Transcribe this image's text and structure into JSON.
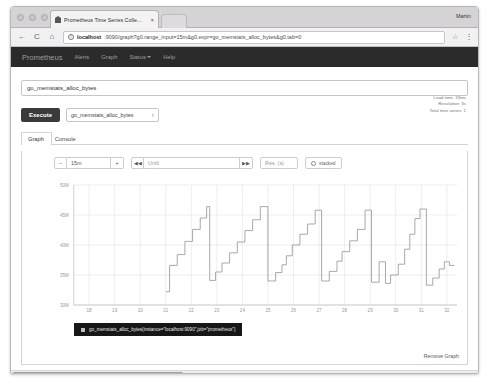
{
  "browser": {
    "tab_title": "Prometheus Time Series Colle...",
    "tab_close": "×",
    "profile_name": "Martin",
    "back_icon": "←",
    "reload_icon": "C",
    "home_icon": "⌂",
    "info_icon": "i",
    "url_host": "localhost",
    "url_path": ":9090/graph?g0.range_input=15m&g0.expr=go_memstats_alloc_bytes&g0.tab=0",
    "star_icon": "☆",
    "menu_icon": "⋮"
  },
  "navbar": {
    "brand": "Prometheus",
    "items": [
      {
        "label": "Alerts",
        "has_caret": false
      },
      {
        "label": "Graph",
        "has_caret": false
      },
      {
        "label": "Status",
        "has_caret": true
      },
      {
        "label": "Help",
        "has_caret": false
      }
    ]
  },
  "query": {
    "expression": "go_memstats_alloc_bytes",
    "placeholder": "Expression (press Shift+Enter for newlines)",
    "execute_label": "Execute",
    "metric_selected": "go_memstats_alloc_bytes",
    "select_arrows": "↕",
    "stats": {
      "load_time": "Load time: 33ms",
      "resolution": "Resolution: 3s",
      "total_time_series": "Total time series: 1"
    }
  },
  "panel_tabs": [
    {
      "label": "Graph",
      "active": true
    },
    {
      "label": "Console",
      "active": false
    }
  ],
  "graph_controls": {
    "decrease_label": "−",
    "range_value": "15m",
    "increase_label": "+",
    "rewind_label": "◀◀",
    "until_placeholder": "Until",
    "forward_label": "▶▶",
    "resolution_placeholder": "Res. (s)",
    "stacked_label": "stacked"
  },
  "legend": {
    "series_label": "go_memstats_alloc_bytes{instance=\"localhost:9090\",job=\"prometheus\"}",
    "color": "#bdbdbd"
  },
  "footer": {
    "remove_graph_label": "Remove Graph"
  },
  "chart_data": {
    "type": "line",
    "title": "",
    "xlabel": "",
    "ylabel": "",
    "series_name": "go_memstats_alloc_bytes{instance=\"localhost:9090\",job=\"prometheus\"}",
    "line_color": "#9a9a9a",
    "grid": true,
    "legend_position": "bottom-left",
    "xlim": [
      17.4,
      32.4
    ],
    "ylim": [
      30,
      50
    ],
    "xticks": [
      18,
      19,
      20,
      21,
      22,
      23,
      24,
      25,
      26,
      27,
      28,
      29,
      30,
      31,
      32
    ],
    "xticklabels": [
      "18",
      "19",
      "20",
      "21",
      "22",
      "23",
      "24",
      "25",
      "26",
      "27",
      "28",
      "29",
      "30",
      "31",
      "32"
    ],
    "yticks": [
      30,
      35,
      40,
      45,
      50
    ],
    "yticklabels": [
      "30M",
      "35M",
      "40M",
      "45M",
      "50M"
    ],
    "x": [
      21.0,
      21.15,
      21.15,
      21.45,
      21.45,
      21.75,
      21.75,
      22.05,
      22.05,
      22.35,
      22.35,
      22.6,
      22.6,
      22.72,
      22.72,
      22.95,
      22.95,
      23.2,
      23.2,
      23.5,
      23.5,
      23.8,
      23.8,
      24.1,
      24.1,
      24.4,
      24.4,
      24.7,
      24.7,
      25.0,
      25.0,
      25.3,
      25.3,
      25.55,
      25.55,
      25.72,
      25.72,
      25.95,
      25.95,
      26.25,
      26.25,
      26.55,
      26.55,
      26.85,
      26.85,
      27.1,
      27.1,
      27.4,
      27.4,
      27.7,
      27.7,
      27.9,
      27.9,
      28.2,
      28.2,
      28.5,
      28.5,
      28.8,
      28.8,
      29.05,
      29.05,
      29.35,
      29.35,
      29.6,
      29.6,
      29.8,
      29.8,
      30.1,
      30.1,
      30.35,
      30.35,
      30.55,
      30.55,
      30.75,
      30.75,
      30.95,
      30.95,
      31.2,
      31.2,
      31.45,
      31.45,
      31.7,
      31.7,
      31.9,
      31.9,
      32.1,
      32.1,
      32.3
    ],
    "y": [
      32.2,
      32.2,
      36.6,
      36.6,
      38.4,
      38.4,
      40.6,
      40.6,
      42.6,
      42.6,
      44.5,
      44.5,
      46.4,
      46.4,
      34.1,
      34.1,
      35.5,
      35.5,
      37.0,
      37.0,
      38.7,
      38.7,
      40.5,
      40.5,
      42.4,
      42.4,
      44.2,
      44.2,
      46.4,
      46.4,
      34.0,
      34.0,
      35.4,
      35.4,
      36.7,
      36.7,
      38.2,
      38.2,
      40.0,
      40.0,
      41.8,
      41.8,
      43.5,
      43.5,
      45.8,
      45.8,
      34.0,
      34.0,
      35.6,
      35.6,
      37.3,
      37.3,
      38.9,
      38.9,
      40.7,
      40.7,
      42.6,
      42.6,
      45.8,
      45.8,
      33.8,
      33.8,
      37.2,
      37.2,
      33.6,
      33.6,
      35.0,
      35.0,
      36.8,
      36.8,
      39.3,
      39.3,
      41.8,
      41.8,
      44.4,
      44.4,
      46.0,
      46.0,
      33.3,
      33.3,
      34.5,
      34.5,
      36.0,
      36.0,
      37.2,
      37.2,
      36.6,
      36.6
    ]
  }
}
